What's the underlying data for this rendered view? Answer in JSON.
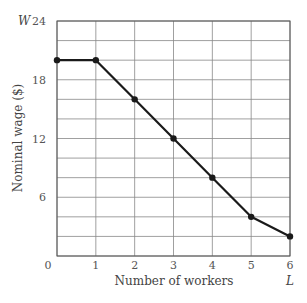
{
  "chart_data": {
    "type": "line",
    "title": "",
    "xlabel": "Number of workers",
    "ylabel": "Nominal wage ($)",
    "x_var": "L",
    "y_var": "W",
    "x": [
      0,
      1,
      2,
      3,
      4,
      5,
      6
    ],
    "series": [
      {
        "name": "Labor demand",
        "values": [
          20,
          20,
          16,
          12,
          8,
          4,
          2
        ],
        "color": "#1a1a1a"
      }
    ],
    "xlim": [
      0,
      6
    ],
    "ylim": [
      0,
      24
    ],
    "x_ticks": [
      "0",
      "1",
      "2",
      "3",
      "4",
      "5",
      "6"
    ],
    "y_ticks": [
      "6",
      "12",
      "18",
      "24"
    ],
    "y_tick_values": [
      6,
      12,
      18,
      24
    ],
    "grid": true,
    "grid_minor_y_step": 2,
    "legend": null
  }
}
